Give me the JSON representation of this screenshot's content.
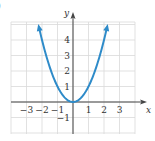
{
  "part_label": ")",
  "chart_data": {
    "type": "line",
    "title": "",
    "function": "y = x^2",
    "xlabel": "x",
    "ylabel": "y",
    "xlim": [
      -4,
      4
    ],
    "ylim": [
      -2,
      5.2
    ],
    "grid": true,
    "x_ticks": [
      -3,
      -2,
      -1,
      1,
      2,
      3
    ],
    "x_tick_labels": [
      "−3",
      "−2",
      "−1",
      "1",
      "2",
      "3"
    ],
    "y_ticks": [
      1,
      2,
      3,
      4,
      -1
    ],
    "y_tick_labels": [
      "1",
      "2",
      "3",
      "4",
      "−1"
    ],
    "series": [
      {
        "name": "parabola",
        "color": "#2e8bc9",
        "x": [
          -2.2,
          -2,
          -1.5,
          -1,
          -0.5,
          0,
          0.5,
          1,
          1.5,
          2,
          2.2
        ],
        "values": [
          4.84,
          4,
          2.25,
          1,
          0.25,
          0,
          0.25,
          1,
          2.25,
          4,
          4.84
        ],
        "arrows_at_ends": true
      }
    ],
    "colors": {
      "curve": "#2e8bc9",
      "grid": "#d9d9d9",
      "axis": "#444444"
    }
  }
}
